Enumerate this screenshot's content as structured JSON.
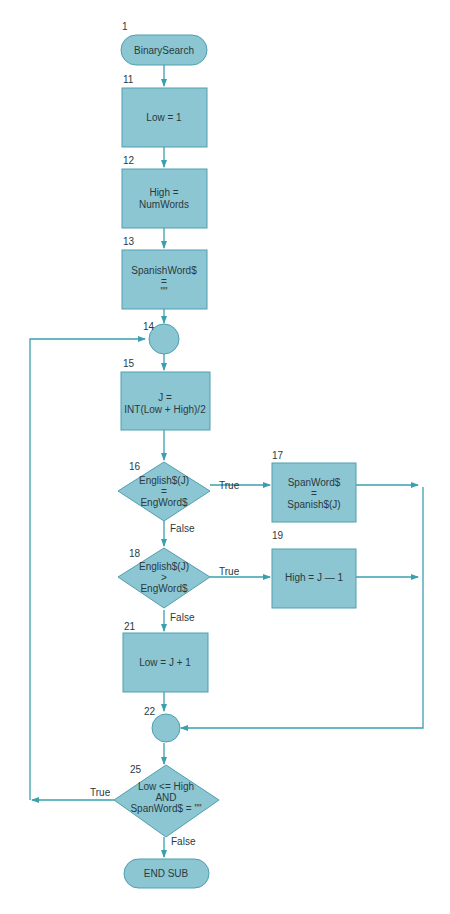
{
  "diagram": {
    "type": "flowchart",
    "title": "BinarySearch",
    "colors": {
      "shape_fill": "#8cc6d2",
      "shape_stroke": "#4f9fb0",
      "line": "#3aa0b0",
      "text": "#2a3a40"
    },
    "nodes": {
      "start": {
        "id": "1",
        "shape": "terminator",
        "lines": [
          "BinarySearch"
        ]
      },
      "n11": {
        "id": "11",
        "shape": "process",
        "lines": [
          "Low = 1"
        ]
      },
      "n12": {
        "id": "12",
        "shape": "process",
        "lines": [
          "High =",
          "NumWords"
        ]
      },
      "n13": {
        "id": "13",
        "shape": "process",
        "lines": [
          "SpanishWord$",
          "=",
          "\"\""
        ]
      },
      "n14": {
        "id": "14",
        "shape": "connector",
        "lines": []
      },
      "n15": {
        "id": "15",
        "shape": "process",
        "lines": [
          "J =",
          "INT(Low + High)/2"
        ]
      },
      "n16": {
        "id": "16",
        "shape": "decision",
        "lines": [
          "English$(J)",
          "=",
          "EngWord$"
        ]
      },
      "n17": {
        "id": "17",
        "shape": "process",
        "lines": [
          "SpanWord$",
          "=",
          "Spanish$(J)"
        ]
      },
      "n18": {
        "id": "18",
        "shape": "decision",
        "lines": [
          "English$(J)",
          ">",
          "EngWord$"
        ]
      },
      "n19": {
        "id": "19",
        "shape": "process",
        "lines": [
          "High = J — 1"
        ]
      },
      "n21": {
        "id": "21",
        "shape": "process",
        "lines": [
          "Low = J + 1"
        ]
      },
      "n22": {
        "id": "22",
        "shape": "connector",
        "lines": []
      },
      "n25": {
        "id": "25",
        "shape": "decision",
        "lines": [
          "Low <= High",
          "AND",
          "SpanWord$ = \"\""
        ]
      },
      "end": {
        "id": "",
        "shape": "terminator",
        "lines": [
          "END SUB"
        ]
      }
    },
    "edge_labels": {
      "n16_true": "True",
      "n16_false": "False",
      "n18_true": "True",
      "n18_false": "False",
      "n25_true": "True",
      "n25_false": "False"
    },
    "edges": [
      [
        "1",
        "11"
      ],
      [
        "11",
        "12"
      ],
      [
        "12",
        "13"
      ],
      [
        "13",
        "14"
      ],
      [
        "14",
        "15"
      ],
      [
        "15",
        "16"
      ],
      [
        "16",
        "17",
        "True"
      ],
      [
        "16",
        "18",
        "False"
      ],
      [
        "18",
        "19",
        "True"
      ],
      [
        "18",
        "21",
        "False"
      ],
      [
        "17",
        "22"
      ],
      [
        "19",
        "22"
      ],
      [
        "21",
        "22"
      ],
      [
        "22",
        "25"
      ],
      [
        "25",
        "14",
        "True"
      ],
      [
        "25",
        "END SUB",
        "False"
      ]
    ]
  }
}
